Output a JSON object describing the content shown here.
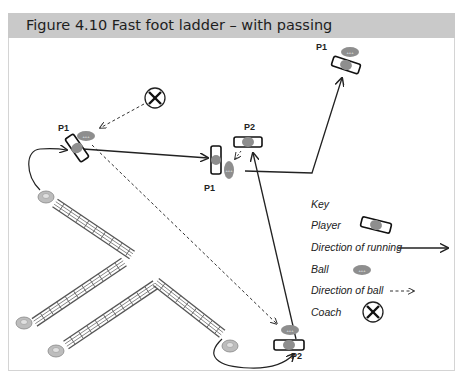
{
  "figure": {
    "title": "Figure 4.10  Fast foot ladder – with passing"
  },
  "players": [
    {
      "label": "P1",
      "position": "left-start"
    },
    {
      "label": "P1",
      "position": "middle"
    },
    {
      "label": "P2",
      "position": "middle-top"
    },
    {
      "label": "P1",
      "position": "top-right"
    },
    {
      "label": "P2",
      "position": "bottom-right"
    }
  ],
  "key": {
    "heading": "Key",
    "items": [
      {
        "label": "Player",
        "icon": "player-icon"
      },
      {
        "label": "Direction of running",
        "icon": "solid-arrow-icon"
      },
      {
        "label": "Ball",
        "icon": "ball-icon"
      },
      {
        "label": "Direction of ball",
        "icon": "dashed-arrow-icon"
      },
      {
        "label": "Coach",
        "icon": "coach-icon"
      }
    ]
  },
  "colors": {
    "header_bg": "#c9c9c9",
    "frame_border": "#d4d4d4",
    "ball": "#8e8e8e",
    "player_body": "#8e8e8e",
    "line": "#222222"
  }
}
